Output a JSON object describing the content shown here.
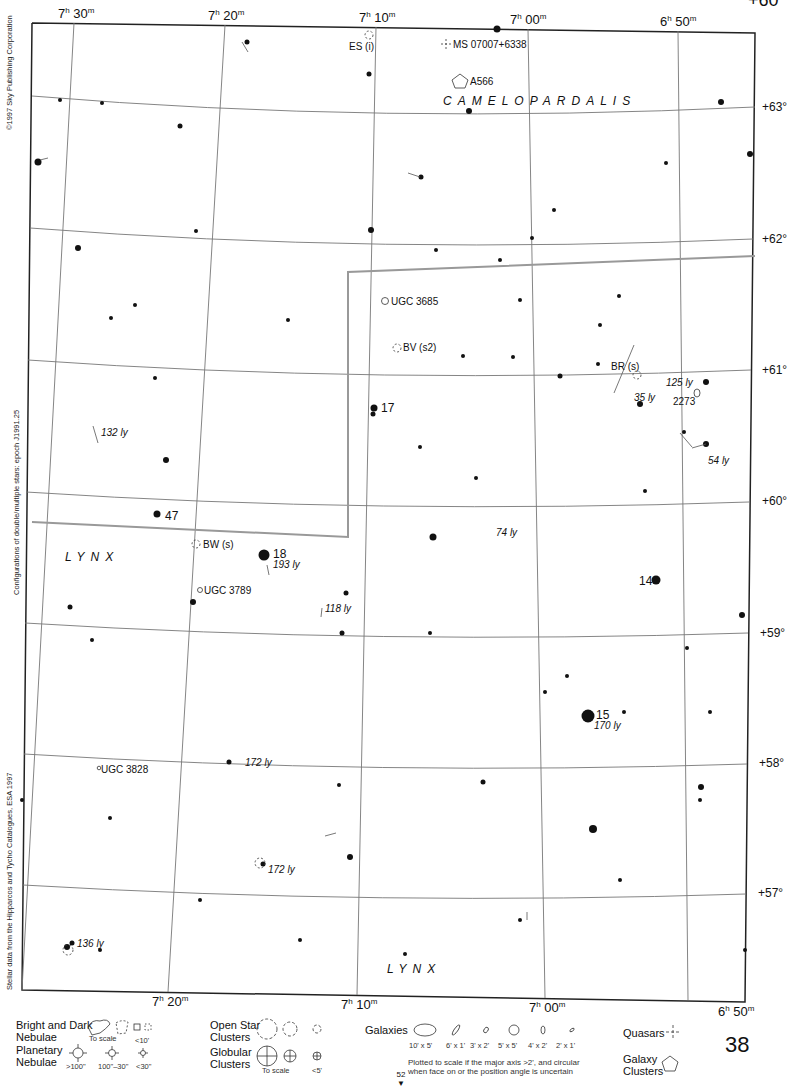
{
  "chart": {
    "number": "38",
    "page_ref": "52",
    "top_partial_text": "+60"
  },
  "ra_top": [
    {
      "h": "7",
      "m": "30"
    },
    {
      "h": "7",
      "m": "20"
    },
    {
      "h": "7",
      "m": "10"
    },
    {
      "h": "7",
      "m": "00"
    },
    {
      "h": "6",
      "m": "50"
    }
  ],
  "ra_bottom": [
    {
      "h": "7",
      "m": "20"
    },
    {
      "h": "7",
      "m": "10"
    },
    {
      "h": "7",
      "m": "00"
    },
    {
      "h": "6",
      "m": "50"
    }
  ],
  "dec_labels": [
    "+63°",
    "+62°",
    "+61°",
    "+60°",
    "+59°",
    "+58°",
    "+57°"
  ],
  "credits": {
    "copyright": "©1997 Sky Publishing Corporation",
    "configurations": "Configurations of double/multiple stars: epoch J1991.25",
    "stellar_data": "Stellar data from the Hipparcos and Tycho Catalogues, ESA 1997"
  },
  "constellations": {
    "camelopardalis": "CAMELOPARDALIS",
    "lynx_upper": "LYNX",
    "lynx_lower": "LYNX"
  },
  "labels": {
    "es": "ES (i)",
    "quasar": "MS 07007+6338",
    "a566": "A566",
    "ugc3685": "UGC 3685",
    "bv": "BV (s2)",
    "br": "BR (s)",
    "ly125": "125 ly",
    "ngc2273": "2273",
    "ly35": "35 ly",
    "ly54": "54 ly",
    "star17": "17",
    "ly132": "132 ly",
    "star47": "47",
    "bw": "BW (s)",
    "star18": "18",
    "ly193": "193 ly",
    "ly74": "74 ly",
    "star14": "14",
    "ugc3789": "UGC 3789",
    "ly118": "118 ly",
    "star15": "15",
    "ly170": "170 ly",
    "ugc3828": "UGC 3828",
    "ly172a": "172 ly",
    "ly172b": "172 ly",
    "ly136": "136 ly"
  },
  "legend": {
    "nebulae": {
      "title_line1": "Bright and Dark",
      "title_line2": "Nebulae",
      "to_scale": "To scale",
      "small": "<10'"
    },
    "planetary": {
      "title_line1": "Planetary",
      "title_line2": "Nebulae",
      "sizes": [
        ">100\"",
        "100\"–30\"",
        "<30\""
      ]
    },
    "open_clusters": {
      "title_line1": "Open Star",
      "title_line2": "Clusters"
    },
    "globular": {
      "title_line1": "Globular",
      "title_line2": "Clusters",
      "to_scale": "To scale",
      "small": "<5'"
    },
    "galaxies": {
      "title": "Galaxies",
      "sizes": [
        "10' x 5'",
        "6' x 1'",
        "3' x 2'",
        "5' x 5'",
        "4' x 2'",
        "2' x 1'"
      ],
      "note_line1": "Plotted to scale if the major axis >2', and circular",
      "note_line2": "when face on or the position angle is uncertain"
    },
    "quasars": {
      "title": "Quasars"
    },
    "galaxy_clusters": {
      "title_line1": "Galaxy",
      "title_line2": "Clusters"
    }
  }
}
